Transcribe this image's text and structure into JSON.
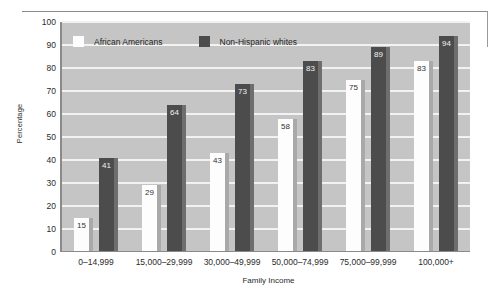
{
  "chart_data": {
    "type": "bar",
    "title": "",
    "xlabel": "Family Income",
    "ylabel": "Percentage",
    "ylim": [
      0,
      100
    ],
    "ytick_step": 10,
    "yticks": [
      "100",
      "90",
      "80",
      "70",
      "60",
      "50",
      "40",
      "30",
      "20",
      "10",
      "0"
    ],
    "grid": true,
    "legend_position": "top-left-inside",
    "categories": [
      "0–14,999",
      "15,000–29,999",
      "30,000–49,999",
      "50,000–74,999",
      "75,000–99,999",
      "100,000+"
    ],
    "series": [
      {
        "name": "African Americans",
        "color": "#fdfdfd",
        "values": [
          15,
          29,
          43,
          58,
          75,
          83
        ]
      },
      {
        "name": "Non-Hispanic whites",
        "color": "#4c4c4c",
        "values": [
          41,
          64,
          73,
          83,
          89,
          94
        ]
      }
    ]
  },
  "colors": {
    "plot_background": "#c5c5c5",
    "gridline": "#f2f2f2",
    "axis": "#8a8a8a",
    "light_bar": "#fdfdfd",
    "dark_bar": "#4c4c4c",
    "light_bar_shadow": "#a9a9a9",
    "dark_bar_shadow": "#6e6e6e",
    "text": "#2b2b2b"
  }
}
